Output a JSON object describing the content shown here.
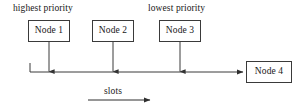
{
  "figure": {
    "background_color": "#ffffff",
    "line_color": "#3a3a3a",
    "text_color": "#181818",
    "width": 296,
    "height": 108
  },
  "annotations": {
    "highest_priority": "highest priority",
    "lowest_priority": "lowest priority",
    "slots_axis": "slots"
  },
  "nodes": [
    {
      "id": "node-1",
      "label": "Node 1",
      "x": 28,
      "y": 20,
      "w": 42,
      "h": 22,
      "stem_x": 49
    },
    {
      "id": "node-2",
      "label": "Node 2",
      "x": 92,
      "y": 20,
      "w": 42,
      "h": 22,
      "stem_x": 113
    },
    {
      "id": "node-3",
      "label": "Node 3",
      "x": 159,
      "y": 20,
      "w": 42,
      "h": 22,
      "stem_x": 180
    },
    {
      "id": "node-4",
      "label": "Node 4",
      "x": 246,
      "y": 61,
      "w": 46,
      "h": 22,
      "stem_x": 269
    }
  ],
  "bus": {
    "y": 72,
    "x_start": 30,
    "x_end": 244,
    "description": "horizontal slot bus running left to right into Node 4"
  },
  "slots_arrow": {
    "x_start": 88,
    "x_end": 152,
    "y": 100,
    "direction": "right"
  }
}
